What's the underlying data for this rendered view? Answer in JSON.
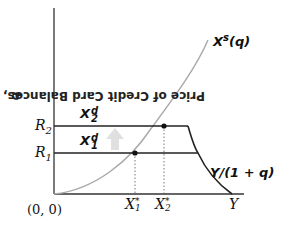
{
  "diagram": {
    "y_axis_label": "Price of Credit Card Balances, ",
    "y_axis_var": "q",
    "origin_label": "(0, 0)",
    "r_levels": [
      {
        "name": "R",
        "sub": "2"
      },
      {
        "name": "R",
        "sub": "1"
      }
    ],
    "demand_labels": [
      {
        "name": "X",
        "sup": "d",
        "sub": "2"
      },
      {
        "name": "X",
        "sup": "d",
        "sub": "1"
      }
    ],
    "supply_label": {
      "name": "X",
      "sup": "s",
      "arg": "(q)"
    },
    "budget_label": "Y/(1 + q)",
    "x_ticks": [
      {
        "name": "X",
        "sub": "1",
        "sup": "*"
      },
      {
        "name": "X",
        "sub": "2",
        "sup": "*"
      },
      {
        "name": "Y"
      }
    ],
    "shift_arrow": "up-arrow",
    "colors": {
      "axes": "#333333",
      "supply_curve": "#a0a0a0",
      "demand_lines": "#222222",
      "arrow": "#dddddd"
    }
  }
}
